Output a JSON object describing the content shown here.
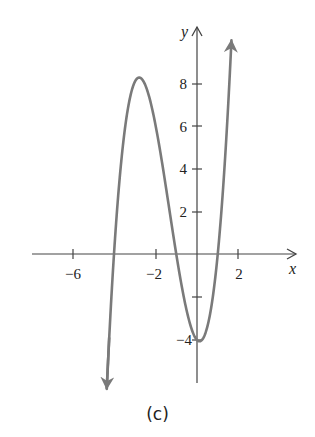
{
  "caption": "(c)",
  "colors": {
    "curve": "#7a7a7a",
    "axis": "#444444",
    "text": "#222222"
  },
  "chart_data": {
    "type": "line",
    "title": "",
    "caption": "(c)",
    "xlabel": "x",
    "ylabel": "y",
    "function": "f(x) = x^3 + 4x^2 - x - 4 = (x+4)(x+1)(x-1)",
    "x_ticks": [
      -6,
      -4,
      -2,
      0,
      2
    ],
    "x_tick_labels": [
      "-6",
      "-2",
      "2"
    ],
    "y_ticks": [
      -4,
      -2,
      2,
      4,
      6,
      8
    ],
    "y_tick_labels": [
      "-4",
      "2",
      "4",
      "6",
      "8"
    ],
    "xlim": [
      -7.8,
      4.7
    ],
    "ylim": [
      -6.2,
      10.5
    ],
    "grid": false,
    "key_points": {
      "x_intercepts": [
        -4,
        -1,
        1
      ],
      "y_intercept": -4,
      "local_max": {
        "x": -2.7,
        "y": 8.2
      },
      "local_min": {
        "x": 0.1,
        "y": -4.05
      }
    },
    "series": [
      {
        "name": "f(x)",
        "x": [
          -4.35,
          -4.0,
          -3.5,
          -3.0,
          -2.7,
          -2.5,
          -2.0,
          -1.5,
          -1.0,
          -0.5,
          0.0,
          0.5,
          1.0,
          1.3,
          1.65
        ],
        "values": [
          -6.25,
          0.0,
          6.56,
          8.0,
          8.18,
          7.88,
          6.0,
          3.13,
          0.0,
          -2.63,
          -4.0,
          -3.38,
          0.0,
          3.79,
          9.73
        ]
      }
    ],
    "arrows": [
      "curve continues down at left end",
      "curve continues up at right end"
    ]
  }
}
